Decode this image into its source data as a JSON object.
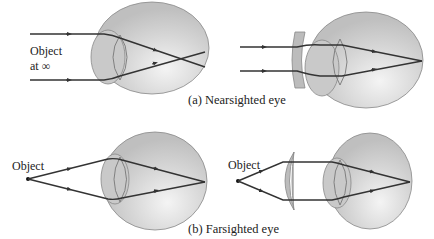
{
  "figure": {
    "panel_a": {
      "caption": "(a) Nearsighted eye",
      "left_label_line1": "Object",
      "left_label_line2": "at ∞",
      "uncorrected": "parallel rays focus in front of retina",
      "corrected_lens": "diverging (concave) lens"
    },
    "panel_b": {
      "caption": "(b) Farsighted eye",
      "left_label": "Object",
      "right_label": "Object",
      "uncorrected": "rays focus behind retina",
      "corrected_lens": "converging (convex) lens"
    },
    "colors": {
      "eye_fill": "#c8c8c8",
      "eye_highlight": "#f2f2f2",
      "lens_fill": "#b8b8b8",
      "ray": "#333333",
      "outline": "#777777"
    }
  }
}
